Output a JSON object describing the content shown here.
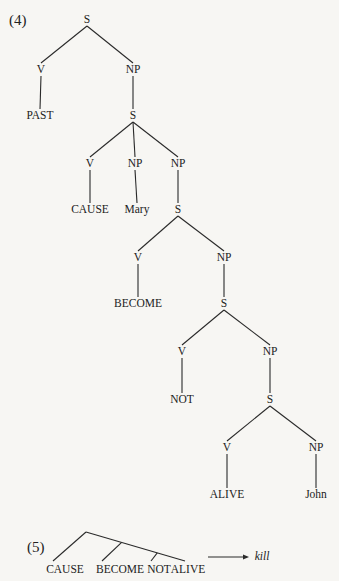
{
  "example4": {
    "number": "(4)",
    "nodes": [
      {
        "id": "s0",
        "label": "S",
        "x": 87,
        "y": 20
      },
      {
        "id": "v0",
        "label": "V",
        "x": 41,
        "y": 70
      },
      {
        "id": "np0",
        "label": "NP",
        "x": 133,
        "y": 70
      },
      {
        "id": "past",
        "label": "PAST",
        "x": 40,
        "y": 116
      },
      {
        "id": "s1",
        "label": "S",
        "x": 133,
        "y": 116
      },
      {
        "id": "v1",
        "label": "V",
        "x": 90,
        "y": 164
      },
      {
        "id": "np1",
        "label": "NP",
        "x": 135,
        "y": 164
      },
      {
        "id": "np2",
        "label": "NP",
        "x": 178,
        "y": 164
      },
      {
        "id": "cause",
        "label": "CAUSE",
        "x": 90,
        "y": 210
      },
      {
        "id": "mary",
        "label": "Mary",
        "x": 137,
        "y": 210
      },
      {
        "id": "s2",
        "label": "S",
        "x": 178,
        "y": 210
      },
      {
        "id": "v2",
        "label": "V",
        "x": 138,
        "y": 258
      },
      {
        "id": "np3",
        "label": "NP",
        "x": 224,
        "y": 258
      },
      {
        "id": "become",
        "label": "BECOME",
        "x": 138,
        "y": 304
      },
      {
        "id": "s3",
        "label": "S",
        "x": 224,
        "y": 304
      },
      {
        "id": "v3",
        "label": "V",
        "x": 182,
        "y": 352
      },
      {
        "id": "np4",
        "label": "NP",
        "x": 270,
        "y": 352
      },
      {
        "id": "not",
        "label": "NOT",
        "x": 182,
        "y": 400
      },
      {
        "id": "s4",
        "label": "S",
        "x": 270,
        "y": 400
      },
      {
        "id": "v4",
        "label": "V",
        "x": 227,
        "y": 448
      },
      {
        "id": "np5",
        "label": "NP",
        "x": 316,
        "y": 448
      },
      {
        "id": "alive",
        "label": "ALIVE",
        "x": 227,
        "y": 495
      },
      {
        "id": "john",
        "label": "John",
        "x": 316,
        "y": 495
      }
    ],
    "edges": [
      [
        "s0",
        "v0"
      ],
      [
        "s0",
        "np0"
      ],
      [
        "v0",
        "past"
      ],
      [
        "np0",
        "s1"
      ],
      [
        "s1",
        "v1"
      ],
      [
        "s1",
        "np1"
      ],
      [
        "s1",
        "np2"
      ],
      [
        "v1",
        "cause"
      ],
      [
        "np1",
        "mary"
      ],
      [
        "np2",
        "s2"
      ],
      [
        "s2",
        "v2"
      ],
      [
        "s2",
        "np3"
      ],
      [
        "v2",
        "become"
      ],
      [
        "np3",
        "s3"
      ],
      [
        "s3",
        "v3"
      ],
      [
        "s3",
        "np4"
      ],
      [
        "v3",
        "not"
      ],
      [
        "np4",
        "s4"
      ],
      [
        "s4",
        "v4"
      ],
      [
        "s4",
        "np5"
      ],
      [
        "v4",
        "alive"
      ],
      [
        "np5",
        "john"
      ]
    ]
  },
  "example5": {
    "number": "(5)",
    "leaves": [
      {
        "label": "CAUSE",
        "x": 65,
        "y": 570
      },
      {
        "label": "BECOME",
        "x": 120,
        "y": 570
      },
      {
        "label": "NOT",
        "x": 159,
        "y": 570
      },
      {
        "label": "ALIVE",
        "x": 188,
        "y": 570
      }
    ],
    "arrow_target": "kill"
  }
}
